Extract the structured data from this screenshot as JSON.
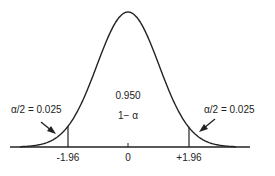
{
  "chart_data": {
    "type": "area",
    "title": "",
    "x_ticks": [
      "-1.96",
      "0",
      "+1.96"
    ],
    "x_tick_values": [
      -1.96,
      0,
      1.96
    ],
    "regions": [
      {
        "name": "left tail",
        "label": "α/2 = 0.025",
        "area": 0.025,
        "range": [
          null,
          -1.96
        ]
      },
      {
        "name": "center",
        "label": "0.950",
        "sublabel": "1− α",
        "area": 0.95,
        "range": [
          -1.96,
          1.96
        ]
      },
      {
        "name": "right tail",
        "label": "α/2 = 0.025",
        "area": 0.025,
        "range": [
          1.96,
          null
        ]
      }
    ],
    "grid": false,
    "legend": "none"
  },
  "labels": {
    "left_tail": "α/2 = 0.025",
    "right_tail": "α/2 = 0.025",
    "center_value": "0.950",
    "center_formula": "1− α",
    "tick_left": "-1.96",
    "tick_center": "0",
    "tick_right": "+1.96"
  }
}
